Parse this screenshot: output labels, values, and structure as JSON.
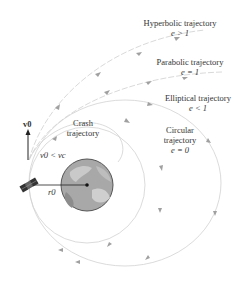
{
  "labels": {
    "hyperbolic": {
      "name": "Hyperbolic trajectory",
      "condition": "e > 1"
    },
    "parabolic": {
      "name": "Parabolic trajectory",
      "condition": "e = 1"
    },
    "elliptical": {
      "name": "Elliptical trajectory",
      "condition": "e < 1"
    },
    "circular": {
      "line1": "Circular",
      "line2": "trajectory",
      "condition": "e = 0"
    },
    "crash": {
      "line1": "Crash",
      "line2": "trajectory",
      "condition": "v0 < vc"
    },
    "velocity": "v0",
    "radius": "r0"
  },
  "colors": {
    "trajectory": "#c8c8c8",
    "arrow": "#9a9a9a",
    "earth": "#9e9e9e",
    "earth_outline": "#555555",
    "text": "#333333",
    "vector": "#222222"
  }
}
